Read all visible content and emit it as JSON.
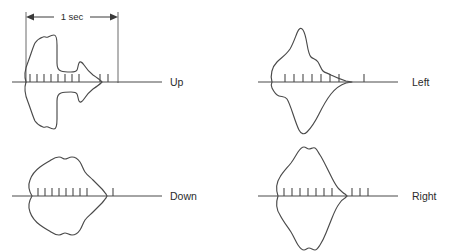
{
  "figure": {
    "background_color": "#ffffff",
    "stroke_color": "#4a4a4a",
    "text_color": "#2b2b2b",
    "scale_bar": {
      "label": "1 sec",
      "x_start": 26,
      "x_end": 118,
      "y_arrow": 17,
      "vert_top": 12,
      "vert_bottom": 83
    },
    "panels": [
      {
        "id": "up",
        "label": "Up",
        "label_x": 170,
        "label_y": 86,
        "baseline_y": 82,
        "baseline_x_start": 12,
        "baseline_x_end": 162,
        "tick_y_top": -8,
        "tick_y_bottom": 0,
        "ticks_x": [
          30,
          37,
          44,
          51,
          58,
          65,
          72,
          79,
          100,
          108
        ],
        "envelope_path": "M26,82 C24,76 25,69 28,62 C31,54 33,47 35,43 C37,40 40,38 43,37 C45,36 46,38 48,37 C50,36 52,35 54,35 C56,35 57,40 57,45 C57,52 57,58 57,63 C57,67 58,70 61,71 C64,72 68,72 71,72 C74,72 76,72 77,70 C78,68 78,65 79,63 C80,61 82,62 84,65 C86,68 89,72 93,75 C96,77 99,79 101,81 L102,82 L101,83 C99,85 96,87 93,89 C89,92 86,96 84,99 C82,102 80,103 79,101 C78,99 78,96 77,94 C76,92 74,92 71,92 C68,92 64,92 61,93 C58,94 57,97 57,101 C57,106 57,112 57,119 C57,124 56,129 54,129 C52,129 50,128 48,127 C46,126 45,128 43,127 C40,126 37,124 35,121 C33,117 31,110 28,102 C25,95 24,88 26,82 Z"
      },
      {
        "id": "left",
        "label": "Left",
        "label_x": 412,
        "label_y": 86,
        "baseline_y": 82,
        "baseline_x_start": 258,
        "baseline_x_end": 398,
        "tick_y_top": -8,
        "tick_y_bottom": 0,
        "ticks_x": [
          285,
          294,
          303,
          312,
          321,
          330,
          339,
          364
        ],
        "envelope_path": "M272,82 C270,75 272,67 277,62 C281,58 286,55 290,49 C293,44 295,38 297,33 C299,28 301,27 303,30 C305,33 306,38 307,44 C308,50 309,55 311,57 C313,59 316,59 318,62 C320,65 321,69 323,71 C325,73 328,73 331,75 C335,77 340,79 346,81 L352,82 L346,83 C340,85 335,89 331,94 C327,99 323,106 319,114 C315,122 311,128 307,132 C304,135 301,134 299,130 C297,126 295,120 293,114 C291,108 289,102 287,99 C285,96 282,97 279,96 C276,95 274,92 272,88 C271,86 271,84 272,82 Z"
      },
      {
        "id": "down",
        "label": "Down",
        "label_x": 170,
        "label_y": 200,
        "baseline_y": 196,
        "baseline_x_start": 12,
        "baseline_x_end": 162,
        "tick_y_top": -8,
        "tick_y_bottom": 0,
        "ticks_x": [
          38,
          45,
          52,
          59,
          66,
          73,
          80,
          87,
          113
        ],
        "envelope_path": "M32,196 C29,191 28,185 30,180 C32,174 36,170 40,167 C44,164 48,162 51,160 C54,158 56,157 59,157 C62,157 63,159 65,159 C67,159 69,157 72,157 C75,157 78,159 80,162 C82,165 83,169 85,172 C87,175 90,177 93,180 C96,183 99,186 102,189 C104,191 105,193 106,194 L107,196 L106,198 C105,199 104,201 102,203 C99,206 96,209 93,212 C90,215 87,217 85,220 C83,223 82,227 80,230 C78,233 75,235 72,235 C69,235 67,233 65,233 C63,233 62,235 59,235 C56,235 54,234 51,232 C48,230 44,228 40,225 C36,222 32,218 30,212 C28,207 29,201 32,196 Z"
      },
      {
        "id": "right",
        "label": "Right",
        "label_x": 412,
        "label_y": 200,
        "baseline_y": 196,
        "baseline_x_start": 258,
        "baseline_x_end": 398,
        "tick_y_top": -8,
        "tick_y_bottom": 0,
        "ticks_x": [
          284,
          292,
          300,
          308,
          316,
          324,
          332,
          352,
          360,
          368
        ],
        "envelope_path": "M278,196 C276,190 276,183 280,177 C283,172 287,168 291,163 C294,159 296,155 298,152 C300,149 302,147 304,147 C306,147 307,149 309,149 C311,149 313,147 315,148 C317,149 318,152 320,155 C322,158 324,162 326,166 C328,170 330,174 332,178 C334,182 336,186 339,189 C341,191 343,193 345,194 L347,196 L345,198 C343,199 341,201 339,204 C336,208 334,213 332,218 C330,223 328,228 326,233 C324,238 322,242 320,245 C318,248 317,250 315,250 C313,250 311,248 309,248 C307,248 306,250 304,250 C302,250 300,248 298,245 C296,242 294,237 291,232 C287,226 283,221 280,215 C276,209 276,202 278,196 Z"
      }
    ]
  }
}
